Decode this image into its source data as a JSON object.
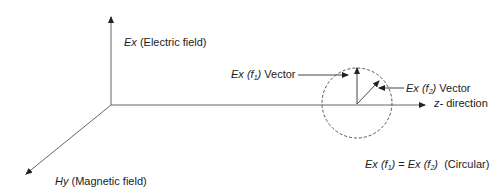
{
  "diagram": {
    "title": "",
    "axes": {
      "vertical": {
        "symbol": "Ex",
        "label": "(Electric field)"
      },
      "horizontal": {
        "symbol": "z-",
        "label": "direction"
      },
      "diagonal": {
        "symbol": "Hy",
        "label": "(Magnetic field)"
      }
    },
    "vectors": {
      "f1": {
        "symbol": "Ex",
        "arg": "f",
        "sub": "1",
        "label": "Vector"
      },
      "f2": {
        "symbol": "Ex",
        "arg": "f",
        "sub": "2",
        "label": "Vector"
      }
    },
    "equation": {
      "lhs_symbol": "Ex",
      "lhs_sub": "1",
      "eq": "=",
      "rhs_symbol": "Ex",
      "rhs_sub": "2",
      "note": "(Circular)"
    },
    "colors": {
      "line": "#555555",
      "text": "#222222",
      "circle": "#555555"
    }
  }
}
